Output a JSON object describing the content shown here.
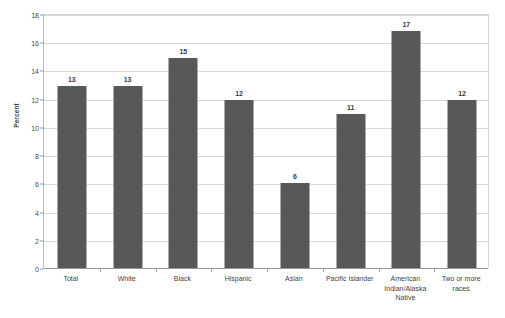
{
  "chart_data": {
    "type": "bar",
    "title": "",
    "xlabel": "",
    "ylabel": "Percent",
    "ylim": [
      0,
      18
    ],
    "ytick_step": 2,
    "yticks": [
      "0",
      "2",
      "4",
      "6",
      "8",
      "10",
      "12",
      "14",
      "16",
      "18"
    ],
    "grid": true,
    "legend": false,
    "bar_color": "#585858",
    "gridline_color": "#d9d9d9",
    "categories": [
      "Total",
      "White",
      "Black",
      "Hispanic",
      "Asian",
      "Pacific Islander",
      "American Indian/Alaska Native",
      "Two or more races"
    ],
    "data_labels": [
      "13",
      "13",
      "15",
      "12",
      "6",
      "11",
      "17",
      "12"
    ],
    "values": [
      12.9,
      12.9,
      14.9,
      11.9,
      6.0,
      10.9,
      16.8,
      11.9
    ],
    "bars": [
      {
        "category": "Total",
        "label_lines": [
          "Total"
        ],
        "value": 12.9,
        "data_label": "13"
      },
      {
        "category": "White",
        "label_lines": [
          "White"
        ],
        "value": 12.9,
        "data_label": "13"
      },
      {
        "category": "Black",
        "label_lines": [
          "Black"
        ],
        "value": 14.9,
        "data_label": "15"
      },
      {
        "category": "Hispanic",
        "label_lines": [
          "Hispanic"
        ],
        "value": 11.9,
        "data_label": "12"
      },
      {
        "category": "Asian",
        "label_lines": [
          "Asian"
        ],
        "value": 6.0,
        "data_label": "6"
      },
      {
        "category": "Pacific Islander",
        "label_lines": [
          "Pacific Islander"
        ],
        "value": 10.9,
        "data_label": "11"
      },
      {
        "category": "American Indian/Alaska Native",
        "label_lines": [
          "American",
          "Indian/Alaska",
          "Native"
        ],
        "value": 16.8,
        "data_label": "17"
      },
      {
        "category": "Two or more races",
        "label_lines": [
          "Two or more",
          "races"
        ],
        "value": 11.9,
        "data_label": "12"
      }
    ]
  }
}
